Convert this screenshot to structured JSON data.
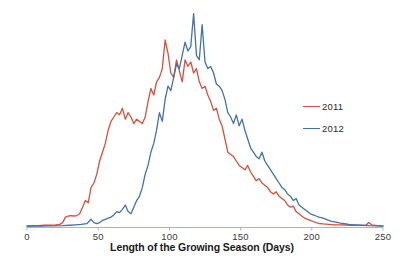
{
  "chart_data": {
    "type": "line",
    "title": "",
    "xlabel": "Length of the Growing Season (Days)",
    "ylabel": "",
    "xlim": [
      0,
      250
    ],
    "ylim": [
      0,
      100
    ],
    "xticks": [
      0,
      50,
      100,
      150,
      200,
      250
    ],
    "xtick_labels": [
      "0",
      "50",
      "100",
      "150",
      "200",
      "250"
    ],
    "yticks": [],
    "ytick_labels": [],
    "grid": false,
    "legend_position": "right",
    "axis_color": "#9fb8cd",
    "series": [
      {
        "name": "2011",
        "color": "#d6503c",
        "x": [
          0,
          4,
          8,
          12,
          16,
          20,
          23,
          25,
          27,
          29,
          31,
          33,
          35,
          37,
          39,
          41,
          43,
          45,
          47,
          49,
          51,
          53,
          55,
          57,
          59,
          61,
          63,
          65,
          67,
          69,
          71,
          73,
          75,
          77,
          79,
          81,
          83,
          85,
          87,
          89,
          91,
          93,
          95,
          97,
          99,
          101,
          103,
          105,
          107,
          109,
          111,
          113,
          115,
          117,
          119,
          121,
          123,
          125,
          127,
          129,
          131,
          133,
          135,
          137,
          139,
          141,
          143,
          145,
          147,
          149,
          151,
          153,
          155,
          157,
          159,
          161,
          163,
          165,
          167,
          169,
          171,
          173,
          175,
          177,
          179,
          181,
          183,
          185,
          187,
          189,
          191,
          193,
          195,
          197,
          199,
          201,
          203,
          205,
          208,
          212,
          216,
          220,
          224,
          228,
          234,
          238,
          240,
          242,
          246,
          250
        ],
        "values": [
          0.5,
          0.6,
          0.6,
          0.8,
          0.8,
          1.0,
          1.2,
          2.0,
          4.5,
          5.0,
          5.2,
          5.0,
          5.2,
          6.0,
          9.0,
          12.0,
          11.0,
          18.0,
          20.0,
          24.0,
          30.0,
          34.0,
          38.0,
          44.0,
          48.0,
          50.0,
          52.0,
          51.0,
          54.0,
          49.0,
          52.0,
          50.0,
          47.0,
          49.0,
          48.0,
          47.0,
          50.0,
          57.0,
          63.0,
          60.0,
          66.0,
          68.0,
          72.0,
          85.0,
          79.0,
          70.0,
          68.0,
          76.0,
          71.0,
          66.0,
          76.0,
          73.0,
          75.0,
          70.0,
          72.0,
          66.0,
          63.0,
          64.0,
          60.0,
          57.0,
          53.0,
          54.0,
          49.0,
          46.0,
          40.0,
          34.0,
          33.0,
          32.0,
          30.0,
          28.0,
          27.0,
          26.0,
          28.0,
          25.0,
          23.0,
          21.0,
          22.0,
          20.0,
          19.0,
          18.0,
          16.0,
          15.0,
          16.0,
          14.0,
          13.0,
          12.0,
          10.0,
          9.0,
          9.5,
          7.0,
          6.0,
          5.0,
          4.0,
          3.5,
          3.0,
          2.5,
          2.0,
          1.6,
          1.4,
          1.2,
          1.0,
          1.0,
          0.9,
          0.8,
          0.7,
          0.8,
          2.0,
          1.0,
          0.6,
          0.5
        ]
      },
      {
        "name": "2012",
        "color": "#4472a8",
        "x": [
          0,
          5,
          10,
          15,
          20,
          25,
          30,
          34,
          38,
          42,
          45,
          47,
          49,
          51,
          53,
          55,
          57,
          59,
          61,
          63,
          65,
          67,
          69,
          71,
          73,
          75,
          77,
          79,
          81,
          83,
          85,
          87,
          89,
          91,
          93,
          95,
          97,
          99,
          101,
          103,
          105,
          107,
          109,
          111,
          113,
          115,
          117,
          119,
          121,
          123,
          125,
          127,
          129,
          131,
          133,
          135,
          137,
          139,
          141,
          143,
          145,
          147,
          149,
          151,
          153,
          155,
          157,
          159,
          161,
          163,
          165,
          167,
          169,
          171,
          173,
          175,
          177,
          179,
          181,
          183,
          185,
          187,
          189,
          191,
          193,
          195,
          197,
          199,
          201,
          203,
          205,
          208,
          211,
          214,
          217,
          220,
          223,
          226,
          230,
          235,
          240,
          245,
          250
        ],
        "values": [
          0.3,
          0.4,
          0.4,
          0.5,
          0.5,
          0.6,
          0.8,
          1.0,
          1.2,
          1.5,
          3.5,
          2.0,
          1.5,
          2.0,
          3.0,
          3.5,
          4.0,
          4.5,
          5.5,
          7.0,
          6.5,
          8.0,
          10.0,
          7.0,
          6.0,
          9.0,
          12.0,
          14.0,
          18.0,
          24.0,
          28.0,
          34.0,
          38.0,
          44.0,
          52.0,
          48.0,
          58.0,
          64.0,
          62.0,
          68.0,
          74.0,
          72.0,
          78.0,
          84.0,
          80.0,
          82.0,
          97.0,
          78.0,
          76.0,
          92.0,
          75.0,
          72.0,
          73.0,
          70.0,
          65.0,
          64.0,
          62.0,
          58.0,
          52.0,
          50.0,
          47.0,
          51.0,
          46.0,
          49.0,
          44.0,
          40.0,
          36.0,
          34.0,
          32.0,
          31.0,
          34.0,
          30.0,
          28.0,
          26.0,
          24.0,
          22.0,
          20.0,
          18.0,
          17.0,
          15.0,
          14.0,
          12.0,
          13.0,
          10.0,
          9.0,
          8.0,
          7.0,
          6.0,
          5.5,
          5.0,
          4.5,
          4.0,
          3.2,
          2.6,
          2.2,
          1.8,
          1.5,
          1.2,
          1.0,
          0.8,
          0.6,
          0.5,
          0.4
        ]
      }
    ]
  },
  "axis": {
    "tick_labels": [
      "0",
      "50",
      "100",
      "150",
      "200",
      "250"
    ],
    "x_title": "Length of the Growing Season (Days)"
  },
  "legend": {
    "items": [
      {
        "label": "2011",
        "color": "#d6503c"
      },
      {
        "label": "2012",
        "color": "#4472a8"
      }
    ]
  }
}
